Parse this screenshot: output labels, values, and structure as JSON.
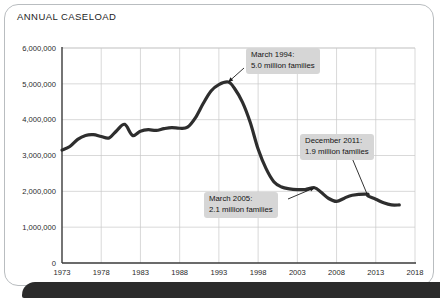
{
  "figure": {
    "title": "ANNUAL CASELOAD"
  },
  "chart_data": {
    "type": "line",
    "title": "ANNUAL CASELOAD",
    "xlabel": "",
    "ylabel": "",
    "xlim": [
      1973,
      2018
    ],
    "ylim": [
      0,
      6000000
    ],
    "grid": true,
    "legend_position": "none",
    "x_ticks": [
      "1973",
      "1978",
      "1983",
      "1988",
      "1993",
      "1998",
      "2003",
      "2008",
      "2013",
      "2018"
    ],
    "y_ticks": [
      "0",
      "1,000,000",
      "2,000,000",
      "3,000,000",
      "4,000,000",
      "5,000,000",
      "6,000,000"
    ],
    "series": [
      {
        "name": "Annual caseload (families)",
        "color": "#2e2e2e",
        "x": [
          1973,
          1974,
          1975,
          1976,
          1977,
          1978,
          1979,
          1980,
          1981,
          1982,
          1983,
          1984,
          1985,
          1986,
          1987,
          1988,
          1989,
          1990,
          1991,
          1992,
          1993,
          1994.2,
          1995,
          1996,
          1997,
          1998,
          1999,
          2000,
          2001,
          2002,
          2003,
          2004,
          2005.2,
          2006,
          2007,
          2008,
          2009,
          2010,
          2011.9,
          2012,
          2013,
          2014,
          2015,
          2016
        ],
        "values": [
          3150000,
          3250000,
          3450000,
          3560000,
          3580000,
          3530000,
          3490000,
          3700000,
          3870000,
          3560000,
          3680000,
          3720000,
          3700000,
          3750000,
          3780000,
          3760000,
          3790000,
          4050000,
          4450000,
          4800000,
          4980000,
          5050000,
          4870000,
          4490000,
          3920000,
          3180000,
          2640000,
          2270000,
          2120000,
          2070000,
          2050000,
          2050000,
          2100000,
          1980000,
          1800000,
          1720000,
          1810000,
          1890000,
          1920000,
          1870000,
          1780000,
          1680000,
          1620000,
          1620000
        ]
      }
    ],
    "annotations": [
      {
        "id": "peak-1994",
        "line1": "March 1994:",
        "line2": "5.0 million families",
        "point_x": 1994.2,
        "point_y": 5050000
      },
      {
        "id": "dec-2011",
        "line1": "December 2011:",
        "line2": "1.9 million families",
        "point_x": 2011.9,
        "point_y": 1920000
      },
      {
        "id": "march-2005",
        "line1": "March 2005:",
        "line2": "2.1 million families",
        "point_x": 2005.2,
        "point_y": 2100000
      }
    ]
  }
}
